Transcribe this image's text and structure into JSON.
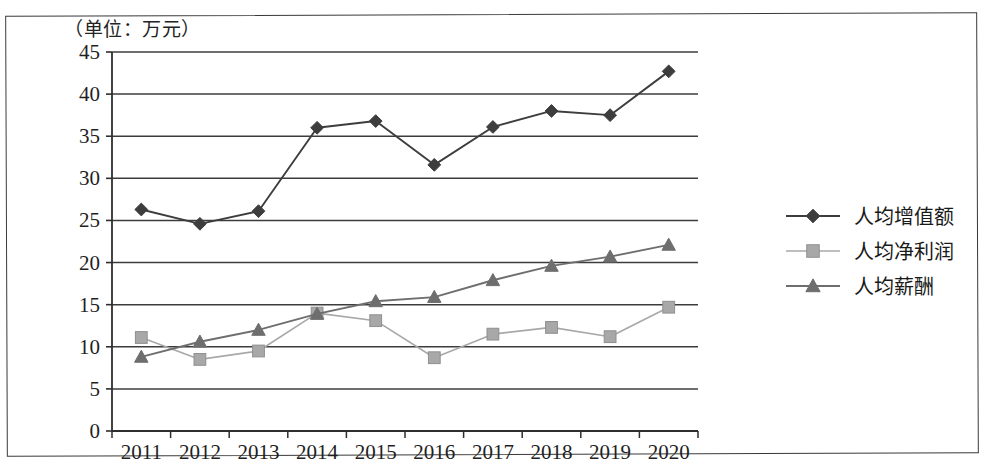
{
  "caption": "（单位：万元）",
  "legend": {
    "position": "right",
    "items": [
      {
        "label": "人均增值额",
        "marker": "diamond-marker-icon",
        "color": "#3d3d3d"
      },
      {
        "label": "人均净利润",
        "marker": "square-marker-icon",
        "color": "#a8a8a8"
      },
      {
        "label": "人均薪酬",
        "marker": "triangle-marker-icon",
        "color": "#6e6e6e"
      }
    ]
  },
  "axis": {
    "y_ticks": [
      "0",
      "5",
      "10",
      "15",
      "20",
      "25",
      "30",
      "35",
      "40",
      "45"
    ],
    "x_ticks": [
      "2011",
      "2012",
      "2013",
      "2014",
      "2015",
      "2016",
      "2017",
      "2018",
      "2019",
      "2020"
    ]
  },
  "chart_data": {
    "type": "line",
    "title": "",
    "subtitle": "",
    "xlabel": "",
    "ylabel": "（单位：万元）",
    "categories": [
      "2011",
      "2012",
      "2013",
      "2014",
      "2015",
      "2016",
      "2017",
      "2018",
      "2019",
      "2020"
    ],
    "ylim": [
      0,
      45
    ],
    "ytick_step": 5,
    "grid": "horizontal",
    "legend_position": "right",
    "series": [
      {
        "name": "人均增值额",
        "marker": "diamond",
        "color": "#3d3d3d",
        "values": [
          26.3,
          24.6,
          26.1,
          36.0,
          36.8,
          31.6,
          36.1,
          38.0,
          37.5,
          42.7
        ]
      },
      {
        "name": "人均净利润",
        "marker": "square",
        "color": "#a8a8a8",
        "values": [
          11.1,
          8.5,
          9.5,
          14.0,
          13.1,
          8.7,
          11.5,
          12.3,
          11.2,
          14.7
        ]
      },
      {
        "name": "人均薪酬",
        "marker": "triangle",
        "color": "#6e6e6e",
        "values": [
          8.8,
          10.6,
          12.0,
          13.9,
          15.4,
          15.9,
          17.9,
          19.6,
          20.7,
          22.1
        ]
      }
    ]
  }
}
